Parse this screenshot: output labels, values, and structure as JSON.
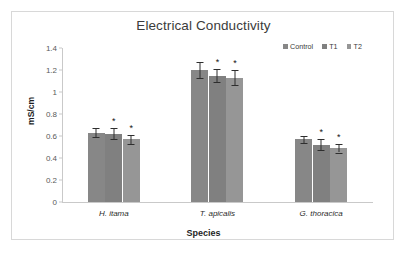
{
  "chart_data": {
    "type": "bar",
    "title": "Electrical Conductivity",
    "xlabel": "Species",
    "ylabel": "mS/cm",
    "categories": [
      "H. itama",
      "T. apicalis",
      "G. thoracica"
    ],
    "ylim": [
      0,
      1.4
    ],
    "yticks": [
      "0",
      "0.2",
      "0.4",
      "0.6",
      "0.8",
      "1",
      "1.2",
      "1.4"
    ],
    "ytick_values": [
      0,
      0.2,
      0.4,
      0.6,
      0.8,
      1.0,
      1.2,
      1.4
    ],
    "grid": false,
    "legend_position": "top-right",
    "series": [
      {
        "name": "Control",
        "color": "#878787",
        "values": [
          0.63,
          1.2,
          0.57
        ],
        "errors": [
          0.04,
          0.07,
          0.03
        ],
        "significance": [
          "",
          "",
          ""
        ]
      },
      {
        "name": "T1",
        "color": "#808080",
        "values": [
          0.62,
          1.15,
          0.52
        ],
        "errors": [
          0.05,
          0.06,
          0.05
        ],
        "significance": [
          "*",
          "*",
          "*"
        ]
      },
      {
        "name": "T2",
        "color": "#969696",
        "values": [
          0.57,
          1.13,
          0.49
        ],
        "errors": [
          0.04,
          0.07,
          0.04
        ],
        "significance": [
          "*",
          "*",
          "*"
        ]
      }
    ]
  }
}
